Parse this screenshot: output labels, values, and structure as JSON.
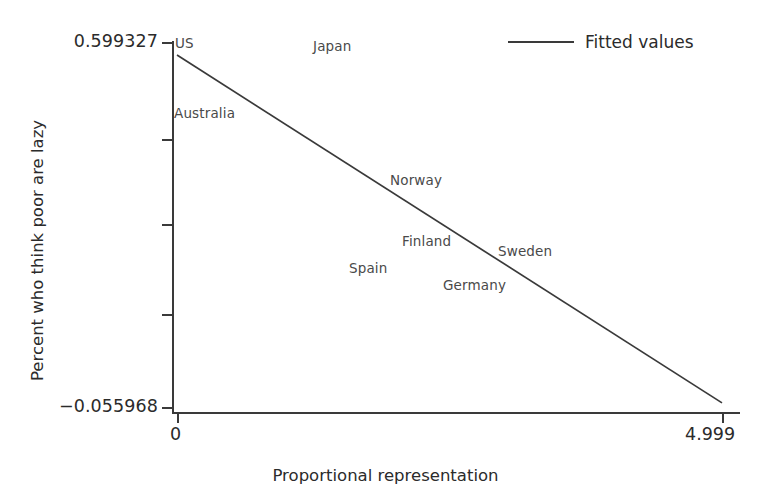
{
  "chart_data": {
    "type": "scatter",
    "title": "",
    "subtitle": "",
    "xlabel": "Proportional representation",
    "ylabel": "Percent who think poor are lazy",
    "xlim": [
      0,
      4.999
    ],
    "ylim": [
      -0.055968,
      0.599327
    ],
    "grid": false,
    "x_ticks": [
      {
        "value": 0,
        "label": "0"
      },
      {
        "value": 4.999,
        "label": "4.999"
      }
    ],
    "y_ticks": [
      {
        "value": 0.599327,
        "label": "0.599327"
      },
      {
        "value": 0.435,
        "label": ""
      },
      {
        "value": 0.292,
        "label": ""
      },
      {
        "value": 0.14,
        "label": ""
      },
      {
        "value": -0.055968,
        "label": "−0.055968"
      }
    ],
    "legend": {
      "position": "top-right",
      "entries": [
        {
          "name": "Fitted values",
          "type": "line",
          "color": "#3a3a3a"
        }
      ]
    },
    "annotations": [
      {
        "label": "US",
        "x": 0.04,
        "y": 0.585
      },
      {
        "label": "Japan",
        "x": 1.28,
        "y": 0.583
      },
      {
        "label": "Australia",
        "x": 0.04,
        "y": 0.455
      },
      {
        "label": "Norway",
        "x": 1.95,
        "y": 0.293
      },
      {
        "label": "Finland",
        "x": 2.12,
        "y": 0.2
      },
      {
        "label": "Sweden",
        "x": 2.99,
        "y": 0.183
      },
      {
        "label": "Spain",
        "x": 1.68,
        "y": 0.153
      },
      {
        "label": "Germany",
        "x": 2.5,
        "y": 0.13
      }
    ],
    "series": [
      {
        "name": "Fitted values",
        "type": "line",
        "color": "#3a3a3a",
        "x": [
          0,
          4.999
        ],
        "y": [
          0.576,
          -0.0486
        ]
      }
    ]
  },
  "axes": {
    "y_top_label": "0.599327",
    "y_bottom_label": "−0.055968",
    "x_left_label": "0",
    "x_right_label": "4.999",
    "y_title": "Percent who think poor are lazy",
    "x_title": "Proportional representation"
  },
  "legend": {
    "label": "Fitted values"
  },
  "labels": {
    "us": "US",
    "japan": "Japan",
    "australia": "Australia",
    "norway": "Norway",
    "finland": "Finland",
    "sweden": "Sweden",
    "spain": "Spain",
    "germany": "Germany"
  },
  "colors": {
    "background": "#ffffff",
    "axis": "#3a3a3a",
    "line": "#3a3a3a",
    "tick_text": "#2b2b2b",
    "point_label": "#4a4a4a"
  }
}
